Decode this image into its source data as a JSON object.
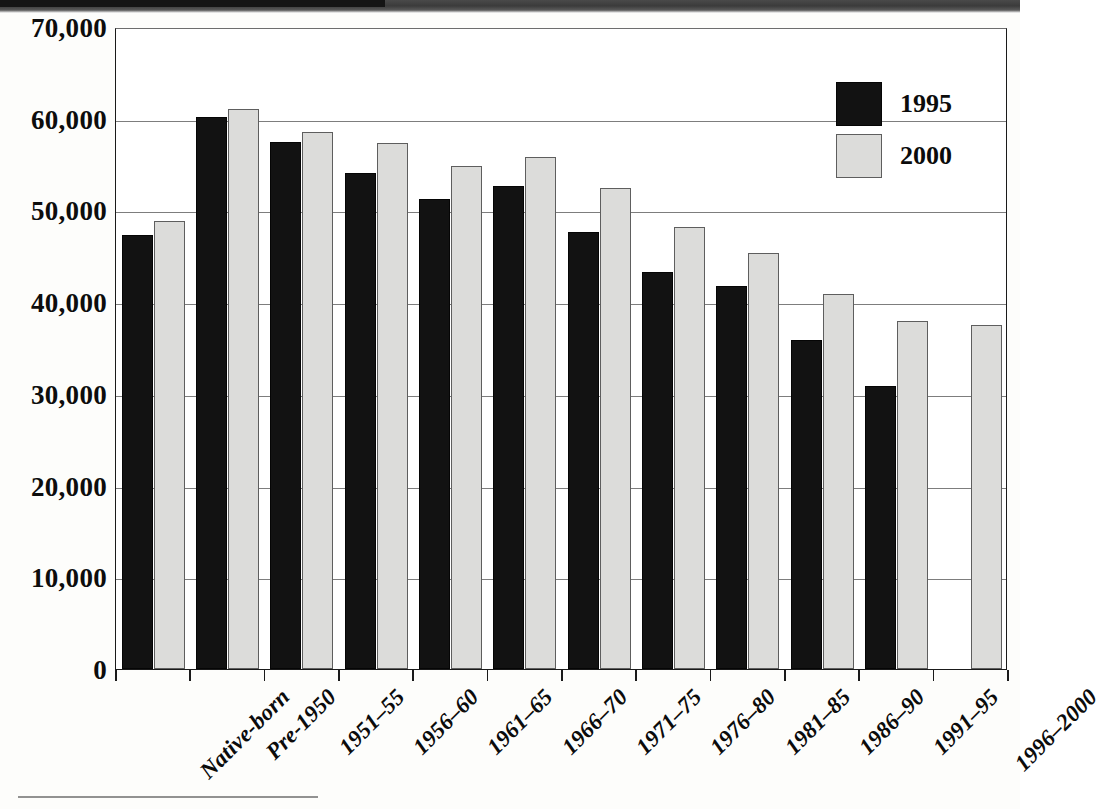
{
  "chart_data": {
    "type": "bar",
    "title": "",
    "subtitle": "",
    "xlabel": "",
    "ylabel": "",
    "ylim": [
      0,
      70000
    ],
    "ytick_values": [
      0,
      10000,
      20000,
      30000,
      40000,
      50000,
      60000,
      70000
    ],
    "ytick_labels": [
      "0",
      "10,000",
      "20,000",
      "30,000",
      "40,000",
      "50,000",
      "60,000",
      "70,000"
    ],
    "grid": true,
    "legend_position": "top-right",
    "categories": [
      "Native-born",
      "Pre-1950",
      "1951–55",
      "1956–60",
      "1961–65",
      "1966–70",
      "1971–75",
      "1976–80",
      "1981–85",
      "1986–90",
      "1991–95",
      "1996–2000"
    ],
    "series": [
      {
        "name": "1995",
        "color": "#121212",
        "values": [
          47300,
          60200,
          57500,
          54100,
          51200,
          52700,
          47600,
          43300,
          41800,
          35900,
          30900,
          null
        ]
      },
      {
        "name": "2000",
        "color": "#dcdcda",
        "values": [
          48900,
          61100,
          58500,
          57400,
          54800,
          55800,
          52500,
          48200,
          45400,
          40900,
          37900,
          37500
        ]
      }
    ]
  },
  "legend": {
    "items": [
      {
        "label": "1995",
        "swatch": "black-filled-square"
      },
      {
        "label": "2000",
        "swatch": "light-gray-square"
      }
    ]
  }
}
